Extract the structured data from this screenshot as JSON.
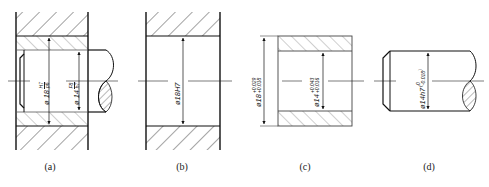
{
  "figure": {
    "panels": [
      {
        "id": "a",
        "caption": "(a)",
        "description": "Assembly: housing, bushing and shaft",
        "dimensions": [
          {
            "symbol": "ø",
            "size": "18",
            "numerator": "H7",
            "denominator": "p6"
          },
          {
            "symbol": "ø",
            "size": "14",
            "numerator": "F8",
            "denominator": "h7"
          }
        ]
      },
      {
        "id": "b",
        "caption": "(b)",
        "description": "Housing bore",
        "dimensions": [
          {
            "text": "ø18H7"
          }
        ]
      },
      {
        "id": "c",
        "caption": "(c)",
        "description": "Bushing",
        "dimensions": [
          {
            "symbol": "ø",
            "size": "18",
            "upper": "+0.029",
            "lower": "+0.018"
          },
          {
            "symbol": "ø",
            "size": "14",
            "upper": "+0.043",
            "lower": "+0.016"
          }
        ]
      },
      {
        "id": "d",
        "caption": "(d)",
        "description": "Shaft",
        "dimensions": [
          {
            "symbol": "ø",
            "size": "14h7",
            "upper": "0",
            "lower": "-0.018"
          }
        ]
      }
    ],
    "colors": {
      "line": "#1a1a1a",
      "hatch": "#333333",
      "bushing_hatch": "#777777",
      "background": "#ffffff"
    }
  }
}
